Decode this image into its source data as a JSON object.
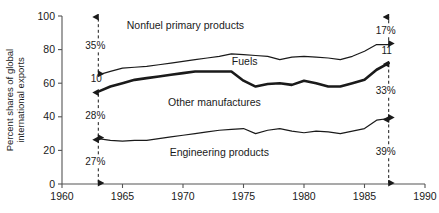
{
  "chart_data": {
    "type": "line",
    "title": "",
    "subtitle": "",
    "xlabel": "",
    "ylabel": "Percent shares of global\ninternational exports",
    "ylabel_line1": "Percent shares of global",
    "ylabel_line2": "international exports",
    "xlim": [
      1960,
      1990
    ],
    "ylim": [
      0,
      100
    ],
    "grid": false,
    "legend_position": "inline-annotations",
    "x_ticks": [
      1960,
      1965,
      1970,
      1975,
      1980,
      1985,
      1990
    ],
    "x_tick_labels": [
      "1960",
      "1965",
      "1970",
      "1975",
      "1980",
      "1985",
      "1990"
    ],
    "y_ticks": [
      0,
      20,
      40,
      60,
      80,
      100
    ],
    "y_tick_labels": [
      "0",
      "20",
      "40",
      "60",
      "80",
      "100"
    ],
    "stacking_note": "cumulative boundary lines; bands read top-to-bottom",
    "series": [
      {
        "name": "Nonfuel primary products boundary",
        "band_label": "Nonfuel primary products",
        "line_weight": "thin",
        "x": [
          1963,
          1964,
          1965,
          1966,
          1967,
          1968,
          1969,
          1970,
          1971,
          1972,
          1973,
          1974,
          1975,
          1976,
          1977,
          1978,
          1979,
          1980,
          1981,
          1982,
          1983,
          1984,
          1985,
          1986,
          1987
        ],
        "values": [
          65,
          67,
          69,
          69.5,
          70,
          71,
          72,
          73,
          74,
          75,
          76,
          77.5,
          77,
          76.5,
          76,
          74,
          75.5,
          76,
          75.5,
          75,
          74,
          76,
          79,
          83,
          83
        ]
      },
      {
        "name": "Fuels boundary",
        "band_label": "Fuels",
        "line_weight": "thick",
        "x": [
          1963,
          1964,
          1965,
          1966,
          1967,
          1968,
          1969,
          1970,
          1971,
          1972,
          1973,
          1974,
          1975,
          1976,
          1977,
          1978,
          1979,
          1980,
          1981,
          1982,
          1983,
          1984,
          1985,
          1986,
          1987
        ],
        "values": [
          55,
          58,
          60,
          62,
          63,
          64,
          65,
          66,
          67,
          67,
          67,
          67,
          61.5,
          58,
          59.5,
          60,
          59,
          61.5,
          60,
          58,
          58,
          60,
          62,
          68,
          72
        ]
      },
      {
        "name": "Other manufactures boundary",
        "band_label": "Other manufactures",
        "line_weight": "thin",
        "x": [
          1963,
          1964,
          1965,
          1966,
          1967,
          1968,
          1969,
          1970,
          1971,
          1972,
          1973,
          1974,
          1975,
          1976,
          1977,
          1978,
          1979,
          1980,
          1981,
          1982,
          1983,
          1984,
          1985,
          1986,
          1987
        ],
        "values": [
          27,
          26,
          25.5,
          26,
          26,
          27,
          28,
          29,
          30,
          31,
          32,
          32.5,
          33,
          30,
          32,
          33,
          31.5,
          30.5,
          31.5,
          31,
          30,
          31.5,
          33,
          38,
          39
        ]
      }
    ],
    "band_labels": [
      {
        "text": "Nonfuel primary products",
        "x": 1970.2,
        "y": 92
      },
      {
        "text": "Fuels",
        "x": 1975.1,
        "y": 71
      },
      {
        "text": "Other manufactures",
        "x": 1972.6,
        "y": 46.5
      },
      {
        "text": "Engineering products",
        "x": 1973.0,
        "y": 16.5
      }
    ],
    "annotations": [
      {
        "label": "35%",
        "x": 1963,
        "from": 65,
        "to": 100,
        "style": "dashed-double-arrow",
        "side": "left"
      },
      {
        "label": "28%",
        "x": 1963,
        "from": 27,
        "to": 55,
        "style": "dashed-double-arrow",
        "side": "left"
      },
      {
        "label": "27%",
        "x": 1963,
        "from": 0,
        "to": 27,
        "style": "dashed-double-arrow",
        "side": "left"
      },
      {
        "label": "17%",
        "x": 1987,
        "from": 83,
        "to": 100,
        "style": "dashed-double-arrow",
        "side": "right"
      },
      {
        "label": "33%",
        "x": 1987,
        "from": 39,
        "to": 72,
        "style": "dashed-double-arrow",
        "side": "right"
      },
      {
        "label": "39%",
        "x": 1987,
        "from": 0,
        "to": 39,
        "style": "dashed-double-arrow",
        "side": "right"
      }
    ],
    "value_labels": [
      {
        "text": "10",
        "x": 1963,
        "y": 60.5,
        "note": "left endpoint fuels band width"
      },
      {
        "text": "11",
        "x": 1987,
        "y": 77.5,
        "note": "right endpoint fuels band width"
      }
    ],
    "colors": {
      "line": "#1a1a1a",
      "axis": "#555555",
      "background": "#ffffff",
      "text": "#111111"
    }
  }
}
